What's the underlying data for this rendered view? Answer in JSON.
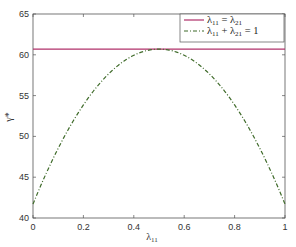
{
  "chart_data": {
    "type": "line",
    "title": "",
    "xlabel": "λ11",
    "ylabel": "γ*",
    "xlim": [
      0,
      1
    ],
    "ylim": [
      40,
      65
    ],
    "xticks": [
      0,
      0.2,
      0.4,
      0.6,
      0.8,
      1
    ],
    "xtick_labels": [
      "0",
      "0.2",
      "0.4",
      "0.6",
      "0.8",
      "1"
    ],
    "yticks": [
      40,
      45,
      50,
      55,
      60,
      65
    ],
    "ytick_labels": [
      "40",
      "45",
      "50",
      "55",
      "60",
      "65"
    ],
    "grid": false,
    "legend_position": "upper right",
    "x": [
      0,
      0.05,
      0.1,
      0.15,
      0.2,
      0.25,
      0.3,
      0.35,
      0.4,
      0.45,
      0.5,
      0.55,
      0.6,
      0.65,
      0.7,
      0.75,
      0.8,
      0.85,
      0.9,
      0.95,
      1
    ],
    "series": [
      {
        "name": "λ11 = λ21",
        "legend_main": "λ",
        "legend_sub1": "11",
        "legend_mid": " = λ",
        "legend_sub2": "21",
        "legend_end": "",
        "color": "#b0306a",
        "style": "solid",
        "values": [
          60.7,
          60.7,
          60.7,
          60.7,
          60.7,
          60.7,
          60.7,
          60.7,
          60.7,
          60.7,
          60.7,
          60.7,
          60.7,
          60.7,
          60.7,
          60.7,
          60.7,
          60.7,
          60.7,
          60.7,
          60.7
        ]
      },
      {
        "name": "λ11 + λ21 = 1",
        "legend_main": "λ",
        "legend_sub1": "11",
        "legend_mid": " + λ",
        "legend_sub2": "21",
        "legend_end": " = 1",
        "color": "#3f6b2a",
        "style": "dashdot",
        "values": [
          41.7,
          45.3,
          48.5,
          51.3,
          53.8,
          56.0,
          57.7,
          59.1,
          60.0,
          60.5,
          60.7,
          60.5,
          60.0,
          59.1,
          57.7,
          56.0,
          53.8,
          51.3,
          48.5,
          45.3,
          41.7
        ]
      }
    ]
  }
}
